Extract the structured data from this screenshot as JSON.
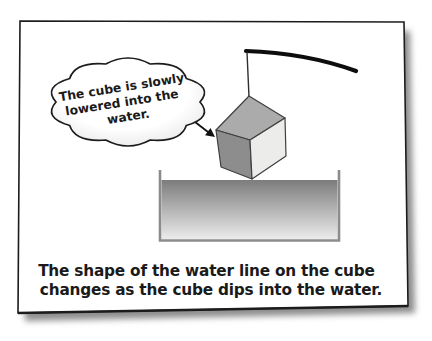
{
  "panel": {
    "background": "#ffffff",
    "border_color": "#1c1c1c",
    "shadow_color": "#8d8d8d"
  },
  "speech_bubble": {
    "lines": [
      "The cube is slowly",
      "lowered into the",
      "water."
    ],
    "fill_center": "#ffffff",
    "fill_edge": "#dedede",
    "outline_color": "#1c1c1c"
  },
  "apparatus": {
    "rod_color": "#0d0d0d",
    "string_color": "#2f2f2f",
    "cube": {
      "top_face_color": "#ababab",
      "left_face_color": "#8d8d8d",
      "right_face_color": "#ececea",
      "edge_color": "#3f3f3f"
    },
    "container": {
      "wall_color": "#8c8c8c",
      "water_top_color": "#7c7c7c",
      "water_bottom_color": "#ebebeb"
    },
    "arrow_color": "#111111"
  },
  "caption": {
    "lines": [
      "The shape of the water line on the cube",
      "changes as the cube dips into the water."
    ],
    "color": "#1a1a1a"
  }
}
